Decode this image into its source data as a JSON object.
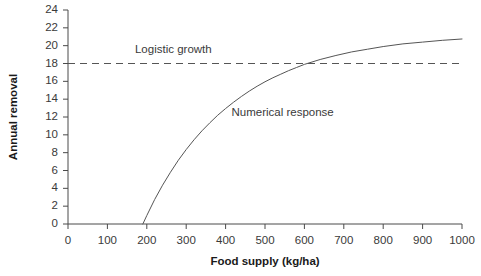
{
  "chart_data": {
    "type": "line",
    "title": "",
    "xlabel": "Food supply (kg/ha)",
    "ylabel": "Annual removal",
    "xlim": [
      0,
      1000
    ],
    "ylim": [
      0,
      24
    ],
    "xticks": [
      0,
      100,
      200,
      300,
      400,
      500,
      600,
      700,
      800,
      900,
      1000
    ],
    "yticks": [
      0,
      2,
      4,
      6,
      8,
      10,
      12,
      14,
      16,
      18,
      20,
      22,
      24
    ],
    "grid": false,
    "legend": "inline-annotations",
    "series": [
      {
        "name": "Logistic growth",
        "style": "dashed",
        "color": "#555555",
        "x": [
          0,
          1000
        ],
        "values": [
          18,
          18
        ]
      },
      {
        "name": "Numerical response",
        "style": "solid",
        "color": "#555555",
        "x": [
          190,
          200,
          220,
          240,
          260,
          280,
          300,
          320,
          340,
          360,
          380,
          400,
          420,
          440,
          460,
          480,
          500,
          520,
          540,
          560,
          580,
          600,
          640,
          680,
          720,
          760,
          800,
          850,
          900,
          950,
          1000
        ],
        "values": [
          0,
          0.95,
          2.75,
          4.35,
          5.8,
          7.15,
          8.35,
          9.45,
          10.45,
          11.35,
          12.2,
          12.95,
          13.65,
          14.3,
          14.9,
          15.45,
          15.95,
          16.4,
          16.8,
          17.2,
          17.55,
          17.9,
          18.45,
          18.9,
          19.3,
          19.6,
          19.9,
          20.2,
          20.4,
          20.6,
          20.75
        ]
      }
    ],
    "annotations": [
      {
        "text": "Logistic growth",
        "x": 170,
        "y": 19.5
      },
      {
        "text": "Numerical response",
        "x": 415,
        "y": 12.4
      }
    ]
  },
  "axis": {
    "x_tick_labels": [
      "0",
      "100",
      "200",
      "300",
      "400",
      "500",
      "600",
      "700",
      "800",
      "900",
      "1000"
    ],
    "y_tick_labels": [
      "0",
      "2",
      "4",
      "6",
      "8",
      "10",
      "12",
      "14",
      "16",
      "18",
      "20",
      "22",
      "24"
    ],
    "x_title": "Food supply (kg/ha)",
    "y_title": "Annual removal"
  },
  "annotations": {
    "logistic_growth": "Logistic growth",
    "numerical_response": "Numerical response"
  },
  "colors": {
    "curve": "#555555",
    "dashed": "#555555",
    "axis": "#4a4a4a",
    "text": "#3a3a3a"
  }
}
